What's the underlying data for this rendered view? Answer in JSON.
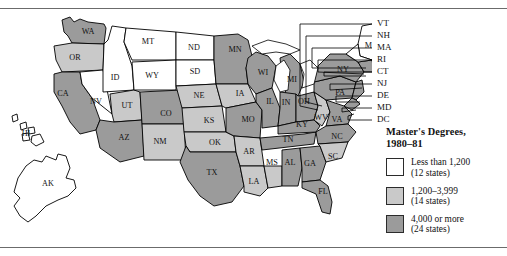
{
  "legend": {
    "title_line1": "Master's Degrees,",
    "title_line2": "1980–81",
    "classes": [
      {
        "label": "Less than 1,200",
        "count": "(12 states)",
        "color": "#ffffff"
      },
      {
        "label": "1,200–3,999",
        "count": "(14 states)",
        "color": "#c9c9c9"
      },
      {
        "label": "4,000 or more",
        "count": "(24 states)",
        "color": "#9b9b9b"
      }
    ]
  },
  "map": {
    "inline_labels": [
      {
        "abbr": "WA",
        "x": 88,
        "y": 22
      },
      {
        "abbr": "OR",
        "x": 75,
        "y": 48
      },
      {
        "abbr": "CA",
        "x": 63,
        "y": 84
      },
      {
        "abbr": "ID",
        "x": 115,
        "y": 68
      },
      {
        "abbr": "NV",
        "x": 96,
        "y": 92
      },
      {
        "abbr": "UT",
        "x": 127,
        "y": 96
      },
      {
        "abbr": "MT",
        "x": 148,
        "y": 32
      },
      {
        "abbr": "WY",
        "x": 152,
        "y": 66
      },
      {
        "abbr": "CO",
        "x": 166,
        "y": 104
      },
      {
        "abbr": "AZ",
        "x": 124,
        "y": 128
      },
      {
        "abbr": "NM",
        "x": 160,
        "y": 132
      },
      {
        "abbr": "ND",
        "x": 194,
        "y": 38
      },
      {
        "abbr": "SD",
        "x": 195,
        "y": 62
      },
      {
        "abbr": "NE",
        "x": 199,
        "y": 86
      },
      {
        "abbr": "KS",
        "x": 209,
        "y": 111
      },
      {
        "abbr": "OK",
        "x": 215,
        "y": 133
      },
      {
        "abbr": "TX",
        "x": 212,
        "y": 163
      },
      {
        "abbr": "MN",
        "x": 235,
        "y": 40
      },
      {
        "abbr": "IA",
        "x": 240,
        "y": 84
      },
      {
        "abbr": "MO",
        "x": 248,
        "y": 110
      },
      {
        "abbr": "AR",
        "x": 249,
        "y": 142
      },
      {
        "abbr": "LA",
        "x": 254,
        "y": 172
      },
      {
        "abbr": "WI",
        "x": 263,
        "y": 63
      },
      {
        "abbr": "IL",
        "x": 270,
        "y": 92
      },
      {
        "abbr": "MS",
        "x": 272,
        "y": 153
      },
      {
        "abbr": "MI",
        "x": 292,
        "y": 70
      },
      {
        "abbr": "IN",
        "x": 286,
        "y": 93
      },
      {
        "abbr": "TN",
        "x": 288,
        "y": 130
      },
      {
        "abbr": "AL",
        "x": 290,
        "y": 153
      },
      {
        "abbr": "OH",
        "x": 304,
        "y": 92
      },
      {
        "abbr": "KY",
        "x": 302,
        "y": 115
      },
      {
        "abbr": "GA",
        "x": 310,
        "y": 154
      },
      {
        "abbr": "WV",
        "x": 321,
        "y": 108
      },
      {
        "abbr": "VA",
        "x": 337,
        "y": 110
      },
      {
        "abbr": "NC",
        "x": 337,
        "y": 127
      },
      {
        "abbr": "SC",
        "x": 333,
        "y": 147
      },
      {
        "abbr": "FL",
        "x": 323,
        "y": 182
      },
      {
        "abbr": "PA",
        "x": 340,
        "y": 83
      },
      {
        "abbr": "NY",
        "x": 343,
        "y": 60
      },
      {
        "abbr": "ME",
        "x": 371,
        "y": 36
      },
      {
        "abbr": "HI",
        "x": 26,
        "y": 124
      },
      {
        "abbr": "AK",
        "x": 48,
        "y": 174
      }
    ],
    "leader_labels": [
      {
        "abbr": "VT",
        "y": 14
      },
      {
        "abbr": "NH",
        "y": 26
      },
      {
        "abbr": "MA",
        "y": 38
      },
      {
        "abbr": "RI",
        "y": 50
      },
      {
        "abbr": "CT",
        "y": 62
      },
      {
        "abbr": "NJ",
        "y": 74
      },
      {
        "abbr": "DE",
        "y": 86
      },
      {
        "abbr": "MD",
        "y": 98
      },
      {
        "abbr": "DC",
        "y": 110
      }
    ]
  }
}
